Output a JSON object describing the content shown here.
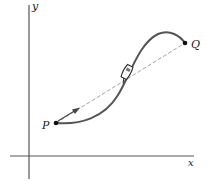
{
  "diagram": {
    "title": "",
    "axes": {
      "x_label": "x",
      "y_label": "y"
    },
    "points": [
      {
        "id": "P",
        "label": "P"
      },
      {
        "id": "Q",
        "label": "Q"
      }
    ],
    "elements": {
      "curve": "path-from-P-to-Q",
      "chord": "dashed-line-P-to-Q",
      "displacement_arrow": "arrow-from-P-along-chord",
      "vehicle": "car-icon-on-curve"
    },
    "colors": {
      "axis": "#555555",
      "curve": "#555555",
      "chord": "#9a9a9a",
      "point": "#111111",
      "text": "#222222"
    }
  }
}
